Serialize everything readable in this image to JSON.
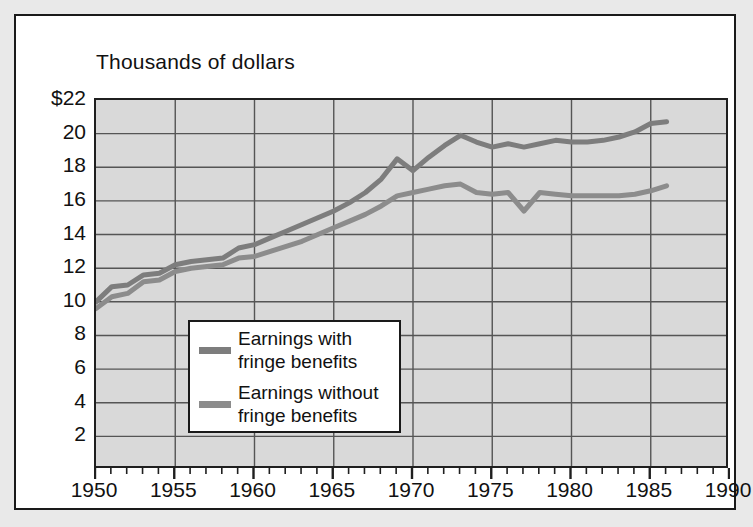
{
  "chart_data": {
    "type": "line",
    "title": "Thousands of dollars",
    "xlabel": "",
    "ylabel": "",
    "xlim": [
      1950,
      1990
    ],
    "ylim": [
      0,
      22
    ],
    "grid": true,
    "legend_position": "inside-lower-left",
    "y_ticks": [
      "$22",
      "20",
      "18",
      "16",
      "14",
      "12",
      "10",
      "8",
      "6",
      "4",
      "2"
    ],
    "y_tick_values": [
      22,
      20,
      18,
      16,
      14,
      12,
      10,
      8,
      6,
      4,
      2
    ],
    "x_ticks": [
      "1950",
      "1955",
      "1960",
      "1965",
      "1970",
      "1975",
      "1980",
      "1985",
      "1990"
    ],
    "x_tick_values": [
      1950,
      1955,
      1960,
      1965,
      1970,
      1975,
      1980,
      1985,
      1990
    ],
    "x_minor_tick_step": 1,
    "series": [
      {
        "name": "Earnings with fringe benefits",
        "color": "#7d7d7d",
        "x": [
          1950,
          1951,
          1952,
          1953,
          1954,
          1955,
          1956,
          1957,
          1958,
          1959,
          1960,
          1961,
          1962,
          1963,
          1964,
          1965,
          1966,
          1967,
          1968,
          1969,
          1970,
          1971,
          1972,
          1973,
          1974,
          1975,
          1976,
          1977,
          1978,
          1979,
          1980,
          1981,
          1982,
          1983,
          1984,
          1985,
          1986
        ],
        "values": [
          10.0,
          10.9,
          11.0,
          11.6,
          11.7,
          12.2,
          12.4,
          12.5,
          12.6,
          13.2,
          13.4,
          13.8,
          14.2,
          14.6,
          15.0,
          15.4,
          15.9,
          16.5,
          17.3,
          18.5,
          17.8,
          18.6,
          19.3,
          19.9,
          19.5,
          19.2,
          19.4,
          19.2,
          19.4,
          19.6,
          19.5,
          19.5,
          19.6,
          19.8,
          20.1,
          20.6,
          20.7
        ]
      },
      {
        "name": "Earnings without fringe benefits",
        "color": "#8c8c8c",
        "x": [
          1950,
          1951,
          1952,
          1953,
          1954,
          1955,
          1956,
          1957,
          1958,
          1959,
          1960,
          1961,
          1962,
          1963,
          1964,
          1965,
          1966,
          1967,
          1968,
          1969,
          1970,
          1971,
          1972,
          1973,
          1974,
          1975,
          1976,
          1977,
          1978,
          1979,
          1980,
          1981,
          1982,
          1983,
          1984,
          1985,
          1986
        ],
        "values": [
          9.6,
          10.3,
          10.5,
          11.2,
          11.3,
          11.8,
          12.0,
          12.1,
          12.2,
          12.6,
          12.7,
          13.0,
          13.3,
          13.6,
          14.0,
          14.4,
          14.8,
          15.2,
          15.7,
          16.3,
          16.5,
          16.7,
          16.9,
          17.0,
          16.5,
          16.4,
          16.5,
          15.4,
          16.5,
          16.4,
          16.3,
          16.3,
          16.3,
          16.3,
          16.4,
          16.6,
          16.9
        ]
      }
    ],
    "legend": [
      {
        "label": "Earnings with\nfringe benefits",
        "color": "#7d7d7d"
      },
      {
        "label": "Earnings without\nfringe benefits",
        "color": "#8c8c8c"
      }
    ],
    "colors": {
      "plot_background": "#d9d9d9",
      "gridline": "#555555",
      "axis": "#1f1f1f",
      "page_background": "#e9e9e9",
      "frame_background": "#ffffff",
      "text": "#111111"
    }
  }
}
